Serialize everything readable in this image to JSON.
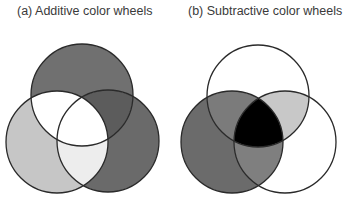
{
  "panels": [
    {
      "id": "a",
      "title": "(a) Additive color wheels",
      "circles": [
        {
          "name": "top",
          "cx": 82,
          "cy": 95,
          "r": 51
        },
        {
          "name": "left",
          "cx": 57,
          "cy": 142,
          "r": 51
        },
        {
          "name": "right",
          "cx": 108,
          "cy": 141,
          "r": 51
        }
      ],
      "regions": {
        "top_only": "#707070",
        "left_only": "#c6c6c6",
        "right_only": "#6a6a6a",
        "top_left": "#ffffff",
        "top_right": "#5c5c5c",
        "left_right": "#ededed",
        "center": "#ffffff"
      }
    },
    {
      "id": "b",
      "title": "(b) Subtractive color wheels",
      "circles": [
        {
          "name": "top",
          "cx": 258,
          "cy": 96,
          "r": 51
        },
        {
          "name": "left",
          "cx": 232,
          "cy": 142,
          "r": 51
        },
        {
          "name": "right",
          "cx": 285,
          "cy": 142,
          "r": 51
        }
      ],
      "regions": {
        "top_only": "#ffffff",
        "left_only": "#6b6b6b",
        "right_only": "#ffffff",
        "top_left": "#7b7b7b",
        "top_right": "#c8c8c8",
        "left_right": "#7f7f7f",
        "center": "#000000"
      }
    }
  ],
  "stroke_color": "#2a2a2a"
}
